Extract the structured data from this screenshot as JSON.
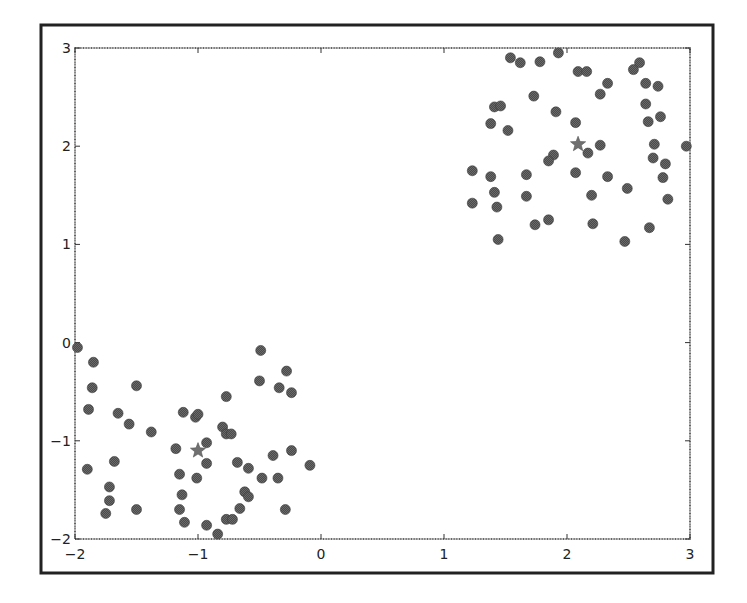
{
  "chart_data": {
    "type": "scatter",
    "title": "",
    "xlabel": "",
    "ylabel": "",
    "xlim": [
      -2,
      3
    ],
    "ylim": [
      -2,
      3
    ],
    "grid": false,
    "legend": null,
    "x_ticks": [
      -2,
      -1,
      0,
      1,
      2,
      3
    ],
    "y_ticks": [
      -2,
      -1,
      0,
      1,
      2,
      3
    ],
    "x_tick_labels": [
      "−2",
      "−1",
      "0",
      "1",
      "2",
      "3"
    ],
    "y_tick_labels": [
      "−2",
      "−1",
      "0",
      "1",
      "2",
      "3"
    ],
    "colors": {
      "points": "#4a4a4a",
      "centroids": "#707070",
      "axes": "#333333",
      "frame": "#222222"
    },
    "series": [
      {
        "name": "cluster-upper-right",
        "marker": "circle",
        "points": [
          [
            1.54,
            2.9
          ],
          [
            1.62,
            2.85
          ],
          [
            1.78,
            2.86
          ],
          [
            1.93,
            2.95
          ],
          [
            2.09,
            2.76
          ],
          [
            2.16,
            2.76
          ],
          [
            2.33,
            2.64
          ],
          [
            2.27,
            2.53
          ],
          [
            2.59,
            2.85
          ],
          [
            2.54,
            2.78
          ],
          [
            2.64,
            2.64
          ],
          [
            2.74,
            2.61
          ],
          [
            1.73,
            2.51
          ],
          [
            1.41,
            2.4
          ],
          [
            1.46,
            2.41
          ],
          [
            1.91,
            2.35
          ],
          [
            1.38,
            2.23
          ],
          [
            1.52,
            2.16
          ],
          [
            2.07,
            2.24
          ],
          [
            2.64,
            2.43
          ],
          [
            2.76,
            2.3
          ],
          [
            2.66,
            2.25
          ],
          [
            2.27,
            2.01
          ],
          [
            2.71,
            2.02
          ],
          [
            2.97,
            2.0
          ],
          [
            2.17,
            1.93
          ],
          [
            1.89,
            1.91
          ],
          [
            1.85,
            1.85
          ],
          [
            2.7,
            1.88
          ],
          [
            2.8,
            1.82
          ],
          [
            1.23,
            1.75
          ],
          [
            1.38,
            1.69
          ],
          [
            1.67,
            1.71
          ],
          [
            2.07,
            1.73
          ],
          [
            2.33,
            1.69
          ],
          [
            2.78,
            1.68
          ],
          [
            2.49,
            1.57
          ],
          [
            1.41,
            1.53
          ],
          [
            1.67,
            1.49
          ],
          [
            2.2,
            1.5
          ],
          [
            2.82,
            1.46
          ],
          [
            1.23,
            1.42
          ],
          [
            1.43,
            1.38
          ],
          [
            1.85,
            1.25
          ],
          [
            1.74,
            1.2
          ],
          [
            2.21,
            1.21
          ],
          [
            2.67,
            1.17
          ],
          [
            2.47,
            1.03
          ],
          [
            1.44,
            1.05
          ]
        ]
      },
      {
        "name": "cluster-lower-left",
        "marker": "circle",
        "points": [
          [
            -1.98,
            -0.05
          ],
          [
            -1.85,
            -0.2
          ],
          [
            -1.86,
            -0.46
          ],
          [
            -1.5,
            -0.44
          ],
          [
            -1.89,
            -0.68
          ],
          [
            -1.65,
            -0.72
          ],
          [
            -1.56,
            -0.83
          ],
          [
            -1.38,
            -0.91
          ],
          [
            -1.12,
            -0.71
          ],
          [
            -1.02,
            -0.76
          ],
          [
            -1.0,
            -0.73
          ],
          [
            -1.18,
            -1.08
          ],
          [
            -1.68,
            -1.21
          ],
          [
            -1.9,
            -1.29
          ],
          [
            -1.72,
            -1.47
          ],
          [
            -1.72,
            -1.61
          ],
          [
            -1.75,
            -1.74
          ],
          [
            -1.5,
            -1.7
          ],
          [
            -1.15,
            -1.34
          ],
          [
            -1.13,
            -1.55
          ],
          [
            -1.15,
            -1.7
          ],
          [
            -1.11,
            -1.83
          ],
          [
            -1.01,
            -1.38
          ],
          [
            -0.93,
            -1.02
          ],
          [
            -0.93,
            -1.23
          ],
          [
            -0.8,
            -0.86
          ],
          [
            -0.77,
            -0.93
          ],
          [
            -0.73,
            -0.93
          ],
          [
            -0.77,
            -0.55
          ],
          [
            -0.49,
            -0.08
          ],
          [
            -0.5,
            -0.39
          ],
          [
            -0.34,
            -0.46
          ],
          [
            -0.24,
            -0.51
          ],
          [
            -0.28,
            -0.29
          ],
          [
            -0.68,
            -1.22
          ],
          [
            -0.59,
            -1.28
          ],
          [
            -0.39,
            -1.15
          ],
          [
            -0.24,
            -1.1
          ],
          [
            -0.09,
            -1.25
          ],
          [
            -0.48,
            -1.38
          ],
          [
            -0.35,
            -1.38
          ],
          [
            -0.62,
            -1.52
          ],
          [
            -0.59,
            -1.57
          ],
          [
            -0.66,
            -1.69
          ],
          [
            -0.77,
            -1.8
          ],
          [
            -0.72,
            -1.8
          ],
          [
            -0.29,
            -1.7
          ],
          [
            -0.93,
            -1.86
          ],
          [
            -0.84,
            -1.95
          ]
        ]
      },
      {
        "name": "centroids",
        "marker": "star",
        "points": [
          [
            2.09,
            2.02
          ],
          [
            -1.0,
            -1.1
          ]
        ]
      }
    ]
  }
}
